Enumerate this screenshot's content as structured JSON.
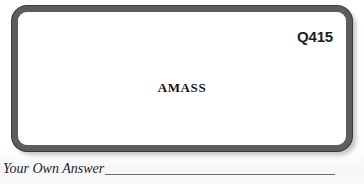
{
  "page": {
    "background_color": "#ffffff",
    "ink_color": "#1d1d1d"
  },
  "card": {
    "code": "Q415",
    "term": "AMASS",
    "border_color": "#5d5d5d",
    "border_outline_color": "#2b2b2b",
    "face_color": "#ffffff",
    "shadow_color": "#b9b9b9"
  },
  "answer": {
    "label": "Your Own Answer",
    "value": "",
    "placeholder": "",
    "rule_color": "#6e6e6e"
  }
}
